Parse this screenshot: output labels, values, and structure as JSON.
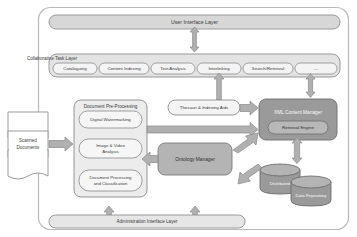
{
  "diagram": {
    "outer_frame": {
      "name": "system-boundary"
    },
    "layers": {
      "user_interface": {
        "label": "User Interface Layer"
      },
      "collaborative_task": {
        "label": "Collaborative Task Layer",
        "tasks": [
          {
            "label": "Cataloguing"
          },
          {
            "label": "Content Indexing"
          },
          {
            "label": "Text Analysis"
          },
          {
            "label": "Interlinking"
          },
          {
            "label": "Search/Retrieval"
          },
          {
            "label": "..."
          }
        ]
      },
      "administration_interface": {
        "label": "Administration Interface Layer"
      }
    },
    "input": {
      "label_line1": "Scanned",
      "label_line2": "Documents"
    },
    "preprocessing": {
      "label": "Document Pre-Processing",
      "modules": [
        {
          "label": "Digital Watermarking"
        },
        {
          "label_line1": "Image & Video",
          "label_line2": "Analysis"
        },
        {
          "label_line1": "Document Processing",
          "label_line2": "and Classification"
        }
      ]
    },
    "thesauri": {
      "label": "Thesauri & Indexing Aids"
    },
    "ontology": {
      "label": "Ontology Manager"
    },
    "content_manager": {
      "label": "XML Content Manager",
      "retrieval_engine": {
        "label": "Retrieval Engine"
      }
    },
    "storage": [
      {
        "label": "Distributed"
      },
      {
        "label": "Data Repository"
      }
    ]
  },
  "colors": {
    "frame_stroke": "#b9b9b9",
    "layer_fill": "#d7d7d7",
    "layer_stroke": "#8f8f8f",
    "pill_fill": "#f4f4f4",
    "pill_stroke": "#8a8a8a",
    "group_fill": "#ececec",
    "group_stroke": "#8a8a8a",
    "dark_fill": "#9a9a9a",
    "dark_stroke": "#6d6d6d",
    "mid_fill": "#b4b4b4",
    "arrow_fill": "#b0b0b0",
    "arrow_stroke": "#8a8a8a",
    "doc_stroke": "#9b9b9b",
    "text": "#3b3b3b"
  }
}
